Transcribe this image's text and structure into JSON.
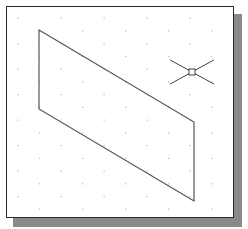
{
  "drawing": {
    "grid": {
      "type": "isometric-dots",
      "color": "#b8b8b8",
      "origin_x": 18,
      "origin_y": 18,
      "step_x": 43,
      "step_y": 25.5,
      "stagger_x": 21.5,
      "stagger_y": 12.75
    },
    "parallelogram": {
      "stroke": "#555555",
      "points": [
        [
          39,
          30
        ],
        [
          194,
          122
        ],
        [
          194,
          201
        ],
        [
          39,
          109
        ]
      ]
    },
    "crosshair": {
      "center": [
        192,
        72
      ],
      "arm_length": 22,
      "box_size": 6,
      "stroke": "#444444"
    },
    "frame": {
      "border_color": "#2a2a2a",
      "shadow_color": "#8a8a8a"
    }
  }
}
